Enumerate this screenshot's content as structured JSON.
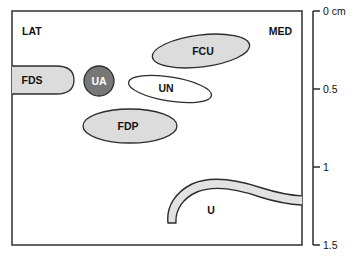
{
  "figure": {
    "orientation": {
      "left_label": "LAT",
      "right_label": "MED"
    },
    "frame": {
      "x": 12,
      "y": 11,
      "width": 290,
      "height": 234,
      "stroke": "#3b3b3b",
      "fill": "#ffffff"
    },
    "colors": {
      "muscle_fill": "#dcdcdc",
      "nerve_fill": "#ffffff",
      "artery_fill": "#777777",
      "bone_fill": "#e2e2e2",
      "outline": "#2b2b2b"
    },
    "structures": [
      {
        "id": "fcu",
        "label": "FCU",
        "kind": "muscle",
        "label_x": 203,
        "label_y": 52,
        "cx": 201,
        "cy": 51,
        "rx": 49,
        "ry": 16,
        "rotation": -7
      },
      {
        "id": "fds",
        "label": "FDS",
        "kind": "muscle",
        "label_x": 32,
        "label_y": 81,
        "cx": 36,
        "cy": 80,
        "rx": 38,
        "ry": 14,
        "rotation": 0
      },
      {
        "id": "ua",
        "label": "UA",
        "kind": "artery",
        "label_x": 99,
        "label_y": 81,
        "cx": 99,
        "cy": 81,
        "rx": 15,
        "ry": 15,
        "rotation": 0
      },
      {
        "id": "un",
        "label": "UN",
        "kind": "nerve",
        "label_x": 166,
        "label_y": 89,
        "cx": 170,
        "cy": 89,
        "rx": 42,
        "ry": 12,
        "rotation": 9
      },
      {
        "id": "fdp",
        "label": "FDP",
        "kind": "muscle",
        "label_x": 128,
        "label_y": 127,
        "cx": 130,
        "cy": 126,
        "rx": 47,
        "ry": 17,
        "rotation": 0
      },
      {
        "id": "u",
        "label": "U",
        "kind": "bone",
        "label_x": 211,
        "label_y": 211
      }
    ],
    "ruler": {
      "unit_label": "0 cm",
      "axis_x": 313,
      "top_y": 11,
      "bottom_y": 245,
      "tick_length": 7,
      "ticks": [
        {
          "value": "0 cm",
          "y": 11
        },
        {
          "value": "0.5",
          "y": 89
        },
        {
          "value": "1",
          "y": 167
        },
        {
          "value": "1.5",
          "y": 245
        }
      ]
    }
  }
}
